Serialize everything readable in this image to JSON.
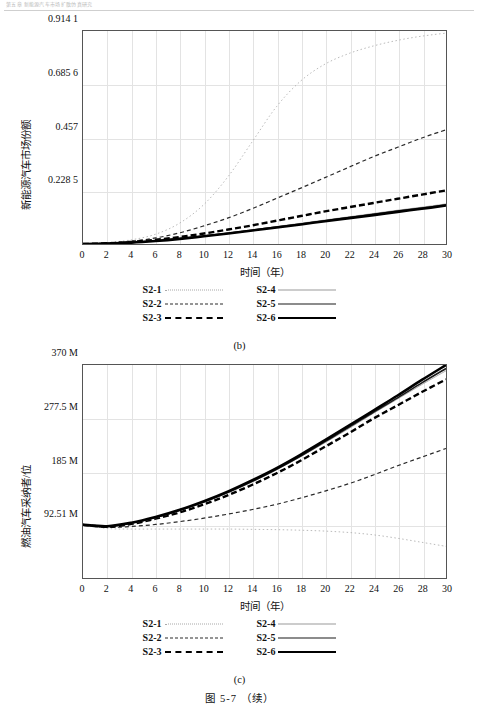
{
  "header": {
    "running_text": "第五章 新能源汽车市场扩散仿真研究"
  },
  "figure": {
    "title": "图 5-7 （续）"
  },
  "panel_b": {
    "caption": "(b)",
    "y_title": "新能源汽车市场份额",
    "x_title": "时间（年）",
    "y_ticks": [
      "0.914 1",
      "0.685 6",
      "0.457",
      "0.228 5"
    ],
    "x_ticks": [
      "0",
      "2",
      "4",
      "6",
      "8",
      "10",
      "12",
      "14",
      "16",
      "18",
      "20",
      "22",
      "24",
      "26",
      "28",
      "30"
    ],
    "legend": [
      {
        "label": "S2-1",
        "style": "sw-dotted"
      },
      {
        "label": "S2-4",
        "style": "sw-thin"
      },
      {
        "label": "S2-2",
        "style": "sw-dashed"
      },
      {
        "label": "S2-5",
        "style": "sw-med"
      },
      {
        "label": "S2-3",
        "style": "sw-bolddash"
      },
      {
        "label": "S2-6",
        "style": "sw-bold"
      }
    ]
  },
  "panel_c": {
    "caption": "(c)",
    "y_title": "燃油汽车采纳者/位",
    "x_title": "时间（年）",
    "y_ticks": [
      "370 M",
      "277.5 M",
      "185 M",
      "92.51 M"
    ],
    "x_ticks": [
      "0",
      "2",
      "4",
      "6",
      "8",
      "10",
      "12",
      "14",
      "16",
      "18",
      "20",
      "22",
      "24",
      "26",
      "28",
      "30"
    ],
    "legend": [
      {
        "label": "S2-1",
        "style": "sw-dotted"
      },
      {
        "label": "S2-4",
        "style": "sw-thin"
      },
      {
        "label": "S2-2",
        "style": "sw-dashed"
      },
      {
        "label": "S2-5",
        "style": "sw-med"
      },
      {
        "label": "S2-3",
        "style": "sw-bolddash"
      },
      {
        "label": "S2-6",
        "style": "sw-bold"
      }
    ]
  },
  "chart_data": [
    {
      "type": "line",
      "id": "panel-b",
      "title": "(b) 新能源汽车市场份额",
      "xlabel": "时间（年）",
      "ylabel": "新能源汽车市场份额",
      "xlim": [
        0,
        30
      ],
      "ylim": [
        0,
        0.9141
      ],
      "grid": true,
      "legend_position": "below",
      "x": [
        0,
        2,
        4,
        6,
        8,
        10,
        12,
        14,
        16,
        18,
        20,
        22,
        24,
        26,
        28,
        30
      ],
      "series": [
        {
          "name": "S2-1",
          "style": "dotted",
          "width": 0.8,
          "color": "#a8a8a8",
          "values": [
            0.0,
            0.006,
            0.018,
            0.042,
            0.09,
            0.17,
            0.29,
            0.44,
            0.59,
            0.7,
            0.772,
            0.818,
            0.85,
            0.874,
            0.892,
            0.905
          ]
        },
        {
          "name": "S2-2",
          "style": "dashed",
          "width": 1.2,
          "color": "#2a2a2a",
          "values": [
            0.0,
            0.004,
            0.012,
            0.026,
            0.048,
            0.078,
            0.112,
            0.152,
            0.196,
            0.24,
            0.285,
            0.33,
            0.375,
            0.415,
            0.455,
            0.49
          ]
        },
        {
          "name": "S2-3",
          "style": "dashed",
          "width": 2.4,
          "color": "#000000",
          "values": [
            0.0,
            0.003,
            0.009,
            0.018,
            0.03,
            0.045,
            0.062,
            0.08,
            0.1,
            0.12,
            0.14,
            0.158,
            0.176,
            0.194,
            0.212,
            0.23
          ]
        },
        {
          "name": "S2-4",
          "style": "solid",
          "width": 0.8,
          "color": "#9a9a9a",
          "values": [
            0.0,
            0.002,
            0.007,
            0.014,
            0.024,
            0.035,
            0.048,
            0.061,
            0.075,
            0.089,
            0.103,
            0.117,
            0.131,
            0.145,
            0.158,
            0.172
          ]
        },
        {
          "name": "S2-5",
          "style": "solid",
          "width": 1.6,
          "color": "#1a1a1a",
          "values": [
            0.0,
            0.002,
            0.007,
            0.014,
            0.023,
            0.034,
            0.046,
            0.059,
            0.073,
            0.086,
            0.1,
            0.114,
            0.127,
            0.141,
            0.154,
            0.168
          ]
        },
        {
          "name": "S2-6",
          "style": "solid",
          "width": 2.6,
          "color": "#000000",
          "values": [
            0.0,
            0.002,
            0.006,
            0.013,
            0.022,
            0.033,
            0.045,
            0.058,
            0.071,
            0.084,
            0.098,
            0.111,
            0.124,
            0.138,
            0.151,
            0.165
          ]
        }
      ]
    },
    {
      "type": "line",
      "id": "panel-c",
      "title": "(c) 燃油汽车采纳者/位",
      "xlabel": "时间（年）",
      "ylabel": "燃油汽车采纳者/位",
      "xlim": [
        0,
        30
      ],
      "ylim": [
        0,
        370
      ],
      "yunit": "M",
      "grid": true,
      "legend_position": "below",
      "x": [
        0,
        2,
        4,
        6,
        8,
        10,
        12,
        14,
        16,
        18,
        20,
        22,
        24,
        26,
        28,
        30
      ],
      "series": [
        {
          "name": "S2-1",
          "style": "dotted",
          "width": 0.8,
          "color": "#a8a8a8",
          "values": [
            92.51,
            86.0,
            85.0,
            85.0,
            85.0,
            85.0,
            85.0,
            84.5,
            84.0,
            83.0,
            81.5,
            79.0,
            75.0,
            69.0,
            62.0,
            55.0
          ]
        },
        {
          "name": "S2-2",
          "style": "dashed",
          "width": 1.2,
          "color": "#2a2a2a",
          "values": [
            92.51,
            88.0,
            89.5,
            93.0,
            98.0,
            104.0,
            111.0,
            119.0,
            128.0,
            139.0,
            151.0,
            164.0,
            179.0,
            195.0,
            210.0,
            225.0
          ]
        },
        {
          "name": "S2-3",
          "style": "dashed",
          "width": 2.4,
          "color": "#000000",
          "values": [
            92.51,
            89.0,
            94.0,
            103.0,
            114.0,
            128.0,
            144.0,
            162.0,
            182.0,
            204.0,
            228.0,
            252.0,
            277.0,
            300.0,
            323.0,
            345.0
          ]
        },
        {
          "name": "S2-4",
          "style": "solid",
          "width": 0.8,
          "color": "#9a9a9a",
          "values": [
            92.51,
            89.5,
            95.0,
            104.5,
            117.0,
            131.5,
            148.0,
            167.0,
            188.0,
            211.0,
            235.0,
            260.0,
            286.0,
            311.0,
            336.0,
            360.0
          ]
        },
        {
          "name": "S2-5",
          "style": "solid",
          "width": 1.6,
          "color": "#1a1a1a",
          "values": [
            92.51,
            89.5,
            95.5,
            105.0,
            117.5,
            132.0,
            149.0,
            168.0,
            189.0,
            212.0,
            237.0,
            262.0,
            288.0,
            313.0,
            339.0,
            364.0
          ]
        },
        {
          "name": "S2-6",
          "style": "solid",
          "width": 2.6,
          "color": "#000000",
          "values": [
            92.51,
            90.0,
            96.0,
            106.0,
            118.5,
            133.5,
            150.5,
            170.0,
            191.0,
            214.5,
            239.5,
            265.0,
            291.0,
            317.0,
            344.0,
            370.0
          ]
        }
      ]
    }
  ]
}
